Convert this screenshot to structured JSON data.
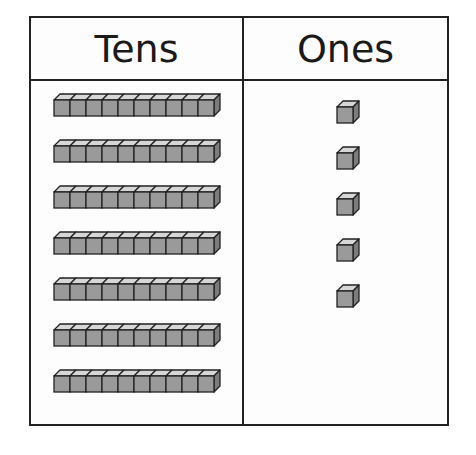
{
  "table": {
    "headers": {
      "tens": "Tens",
      "ones": "Ones"
    }
  },
  "place_value": {
    "tens_rods": 7,
    "cubes_per_rod": 10,
    "ones_cubes": 5,
    "represented_number": 75
  },
  "colors": {
    "cube_front": "#9a9a9a",
    "cube_top": "#d6d6d6",
    "cube_side": "#7c7c7c",
    "outline": "#222222"
  }
}
